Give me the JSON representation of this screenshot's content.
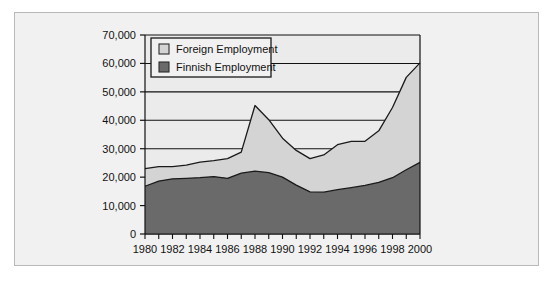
{
  "chart_data": {
    "type": "area",
    "stacked": true,
    "title": "",
    "subtitle": "",
    "xlabel": "",
    "ylabel": "",
    "grid": true,
    "legend_position": "top-left-inside",
    "x": [
      1980,
      1981,
      1982,
      1983,
      1984,
      1985,
      1986,
      1987,
      1988,
      1989,
      1990,
      1991,
      1992,
      1993,
      1994,
      1995,
      1996,
      1997,
      1998,
      1999,
      2000
    ],
    "xlim": [
      1980,
      2000
    ],
    "ylim": [
      0,
      70000
    ],
    "xtick_labels": [
      "1980",
      "1982",
      "1984",
      "1986",
      "1988",
      "1990",
      "1992",
      "1994",
      "1996",
      "1998",
      "2000"
    ],
    "xtick_values": [
      1980,
      1982,
      1984,
      1986,
      1988,
      1990,
      1992,
      1994,
      1996,
      1998,
      2000
    ],
    "xminor_every": 1,
    "ytick_labels": [
      "0",
      "10,000",
      "20,000",
      "30,000",
      "40,000",
      "50,000",
      "60,000",
      "70,000"
    ],
    "ytick_values": [
      0,
      10000,
      20000,
      30000,
      40000,
      50000,
      60000,
      70000
    ],
    "series": [
      {
        "name": "Finnish Employment",
        "color": "#6a6a6a",
        "values": [
          16800,
          18600,
          19400,
          19600,
          19800,
          20200,
          19600,
          21400,
          22100,
          21600,
          20000,
          17200,
          14800,
          14700,
          15600,
          16300,
          17100,
          18200,
          19800,
          22600,
          25200
        ]
      },
      {
        "name": "Foreign Employment",
        "color": "#d4d4d4",
        "values": [
          6200,
          5100,
          4300,
          4600,
          5500,
          5600,
          6900,
          7400,
          23100,
          18600,
          13700,
          12200,
          11700,
          13100,
          15800,
          16300,
          15500,
          18100,
          24700,
          32500,
          35000
        ]
      }
    ],
    "totals": [
      23000,
      23700,
      23700,
      24200,
      25300,
      25800,
      26500,
      28800,
      45200,
      40200,
      33700,
      29400,
      26500,
      27800,
      31400,
      32600,
      32600,
      36300,
      44500,
      55100,
      60200
    ],
    "colors": {
      "foreign": "#d4d4d4",
      "finnish": "#6a6a6a",
      "axis": "#111111",
      "panel": "#f1f1f1",
      "plot_background": "#ebebeb",
      "page_background": "#ffffff"
    }
  },
  "legend": {
    "items": [
      {
        "label": "Foreign Employment",
        "swatch_name": "legend-swatch-foreign"
      },
      {
        "label": "Finnish Employment",
        "swatch_name": "legend-swatch-finnish"
      }
    ]
  }
}
